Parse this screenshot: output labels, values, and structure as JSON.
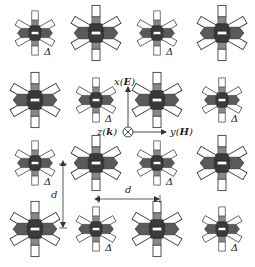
{
  "diagram": {
    "type": "metamaterial-lattice",
    "rows": 4,
    "cols": 4,
    "colors": {
      "background": "#ffffff",
      "arm_fill": "#ffffff",
      "arm_stroke": "#444444",
      "core_dark": "#3a3a3a",
      "core_mid": "#5a5a5a",
      "stub_gray": "#888888",
      "line": "#333333"
    },
    "cells": [
      {
        "row": 0,
        "col": 0,
        "cx": 35,
        "cy": 33,
        "size": "small",
        "label": "Δ"
      },
      {
        "row": 0,
        "col": 1,
        "cx": 96,
        "cy": 33,
        "size": "large",
        "label": ""
      },
      {
        "row": 0,
        "col": 2,
        "cx": 157,
        "cy": 33,
        "size": "small",
        "label": "Δ"
      },
      {
        "row": 0,
        "col": 3,
        "cx": 222,
        "cy": 33,
        "size": "large",
        "label": ""
      },
      {
        "row": 1,
        "col": 0,
        "cx": 35,
        "cy": 100,
        "size": "large",
        "label": ""
      },
      {
        "row": 1,
        "col": 1,
        "cx": 96,
        "cy": 100,
        "size": "small",
        "label": "Δ"
      },
      {
        "row": 1,
        "col": 2,
        "cx": 157,
        "cy": 100,
        "size": "large",
        "label": ""
      },
      {
        "row": 1,
        "col": 3,
        "cx": 222,
        "cy": 100,
        "size": "small",
        "label": "Δ"
      },
      {
        "row": 2,
        "col": 0,
        "cx": 35,
        "cy": 163,
        "size": "small",
        "label": "Δ"
      },
      {
        "row": 2,
        "col": 1,
        "cx": 96,
        "cy": 163,
        "size": "large",
        "label": ""
      },
      {
        "row": 2,
        "col": 2,
        "cx": 157,
        "cy": 163,
        "size": "small",
        "label": "Δ"
      },
      {
        "row": 2,
        "col": 3,
        "cx": 222,
        "cy": 163,
        "size": "large",
        "label": ""
      },
      {
        "row": 3,
        "col": 0,
        "cx": 35,
        "cy": 229,
        "size": "large",
        "label": ""
      },
      {
        "row": 3,
        "col": 1,
        "cx": 96,
        "cy": 229,
        "size": "small",
        "label": "Δ"
      },
      {
        "row": 3,
        "col": 2,
        "cx": 157,
        "cy": 229,
        "size": "large",
        "label": ""
      },
      {
        "row": 3,
        "col": 3,
        "cx": 222,
        "cy": 229,
        "size": "small",
        "label": "Δ"
      }
    ],
    "axes": {
      "x_label": "x(E)",
      "x_label_var": "x",
      "x_label_field": "E",
      "y_label": "y(H)",
      "y_label_var": "y",
      "y_label_field": "H",
      "z_label": "z(k)",
      "z_label_var": "z",
      "z_label_field": "k",
      "origin": {
        "x": 128,
        "y": 132
      }
    },
    "dimensions": [
      {
        "name": "vertical-period",
        "label": "d",
        "orientation": "vertical"
      },
      {
        "name": "horizontal-period",
        "label": "d",
        "orientation": "horizontal"
      }
    ]
  }
}
